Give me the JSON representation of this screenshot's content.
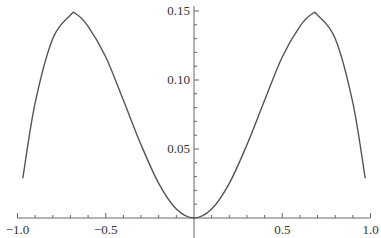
{
  "chart_data": {
    "type": "line",
    "title": "",
    "xlabel": "",
    "ylabel": "",
    "xlim": [
      -1.0,
      1.0
    ],
    "ylim": [
      0,
      0.155
    ],
    "grid": false,
    "legend": null,
    "x_ticks": [
      {
        "value": -1.0,
        "label": "−1.0"
      },
      {
        "value": -0.5,
        "label": "−0.5"
      },
      {
        "value": 0.5,
        "label": "0.5"
      },
      {
        "value": 1.0,
        "label": "1.0"
      }
    ],
    "y_ticks": [
      {
        "value": 0.05,
        "label": "0.05"
      },
      {
        "value": 0.1,
        "label": "0.10"
      },
      {
        "value": 0.15,
        "label": "0.15"
      }
    ],
    "series": [
      {
        "name": "f(x)",
        "color": "#555555",
        "x": [
          -0.97,
          -0.9,
          -0.8,
          -0.7,
          -0.67,
          -0.6,
          -0.5,
          -0.4,
          -0.3,
          -0.2,
          -0.1,
          0,
          0.1,
          0.2,
          0.3,
          0.4,
          0.5,
          0.6,
          0.67,
          0.7,
          0.8,
          0.9,
          0.97
        ],
        "y": [
          0.0288,
          0.0834,
          0.1301,
          0.147,
          0.148,
          0.1389,
          0.1167,
          0.0853,
          0.0531,
          0.0251,
          0.0065,
          0,
          0.0065,
          0.0251,
          0.0531,
          0.0853,
          0.1167,
          0.1389,
          0.148,
          0.147,
          0.1301,
          0.0834,
          0.0288
        ]
      }
    ]
  }
}
